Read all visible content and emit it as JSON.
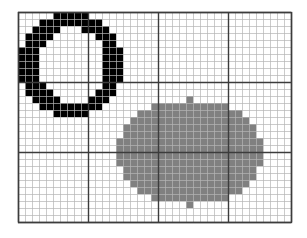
{
  "figure": {
    "title": "",
    "background_color": "#ffffff"
  },
  "grid": {
    "origin_x": 18,
    "origin_y": 12,
    "cell_size": 7,
    "columns": 39,
    "rows": 30,
    "minor_line_color": "#b4b4b4",
    "major_line_color": "#3c3c3c",
    "border_color": "#3c3c3c",
    "minor_line_width": 0.7,
    "major_line_width": 1.4,
    "major_every": 10,
    "major_vertical_cols": [
      0,
      10,
      20,
      30,
      39
    ],
    "major_horizontal_rows": [
      0,
      10,
      20,
      30
    ]
  },
  "shapes": {
    "ring": {
      "name": "black-ring",
      "fill_color": "#000000",
      "type": "annulus",
      "center_col": 7.5,
      "center_row": 7.5,
      "outer_radius_x": 7.0,
      "outer_radius_y": 7.0,
      "inner_radius_x": 4.2,
      "inner_radius_y": 4.6,
      "col_start": 0,
      "row_start": 0,
      "cells": [
        [
          5,
          0
        ],
        [
          6,
          0
        ],
        [
          7,
          0
        ],
        [
          8,
          0
        ],
        [
          9,
          0
        ],
        [
          3,
          1
        ],
        [
          4,
          1
        ],
        [
          5,
          1
        ],
        [
          6,
          1
        ],
        [
          7,
          1
        ],
        [
          8,
          1
        ],
        [
          9,
          1
        ],
        [
          10,
          1
        ],
        [
          11,
          1
        ],
        [
          2,
          2
        ],
        [
          3,
          2
        ],
        [
          4,
          2
        ],
        [
          5,
          2
        ],
        [
          9,
          2
        ],
        [
          10,
          2
        ],
        [
          11,
          2
        ],
        [
          12,
          2
        ],
        [
          1,
          3
        ],
        [
          2,
          3
        ],
        [
          3,
          3
        ],
        [
          4,
          3
        ],
        [
          11,
          3
        ],
        [
          12,
          3
        ],
        [
          13,
          3
        ],
        [
          1,
          4
        ],
        [
          2,
          4
        ],
        [
          3,
          4
        ],
        [
          12,
          4
        ],
        [
          13,
          4
        ],
        [
          0,
          5
        ],
        [
          1,
          5
        ],
        [
          2,
          5
        ],
        [
          12,
          5
        ],
        [
          13,
          5
        ],
        [
          14,
          5
        ],
        [
          0,
          6
        ],
        [
          1,
          6
        ],
        [
          2,
          6
        ],
        [
          12,
          6
        ],
        [
          13,
          6
        ],
        [
          14,
          6
        ],
        [
          0,
          7
        ],
        [
          1,
          7
        ],
        [
          2,
          7
        ],
        [
          12,
          7
        ],
        [
          13,
          7
        ],
        [
          14,
          7
        ],
        [
          0,
          8
        ],
        [
          1,
          8
        ],
        [
          2,
          8
        ],
        [
          12,
          8
        ],
        [
          13,
          8
        ],
        [
          14,
          8
        ],
        [
          0,
          9
        ],
        [
          1,
          9
        ],
        [
          2,
          9
        ],
        [
          12,
          9
        ],
        [
          13,
          9
        ],
        [
          14,
          9
        ],
        [
          1,
          10
        ],
        [
          2,
          10
        ],
        [
          3,
          10
        ],
        [
          12,
          10
        ],
        [
          13,
          10
        ],
        [
          1,
          11
        ],
        [
          2,
          11
        ],
        [
          3,
          11
        ],
        [
          4,
          11
        ],
        [
          11,
          11
        ],
        [
          12,
          11
        ],
        [
          13,
          11
        ],
        [
          2,
          12
        ],
        [
          3,
          12
        ],
        [
          4,
          12
        ],
        [
          5,
          12
        ],
        [
          10,
          12
        ],
        [
          11,
          12
        ],
        [
          12,
          12
        ],
        [
          3,
          13
        ],
        [
          4,
          13
        ],
        [
          5,
          13
        ],
        [
          6,
          13
        ],
        [
          7,
          13
        ],
        [
          8,
          13
        ],
        [
          9,
          13
        ],
        [
          10,
          13
        ],
        [
          11,
          13
        ],
        [
          5,
          14
        ],
        [
          6,
          14
        ],
        [
          7,
          14
        ],
        [
          8,
          14
        ],
        [
          9,
          14
        ]
      ]
    },
    "ellipse": {
      "name": "gray-ellipse",
      "fill_color": "#808080",
      "type": "filled-ellipse",
      "center_col": 24.5,
      "center_row": 20.0,
      "radius_x": 10.5,
      "radius_y": 7.5,
      "col_start": 14,
      "col_end": 35,
      "row_start": 12,
      "row_end": 28
    }
  }
}
